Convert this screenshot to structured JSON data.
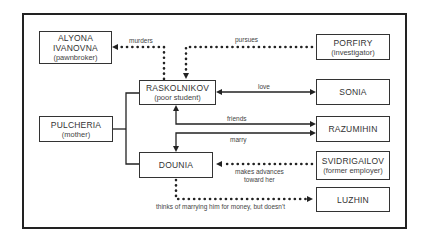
{
  "diagram": {
    "title": "",
    "nodes": [
      {
        "id": "alyona",
        "name": "ALYONA IVANOVNA",
        "name_lines": [
          "ALYONA",
          "IVANOVNA"
        ],
        "role": "(pawnbroker)"
      },
      {
        "id": "porfiry",
        "name": "PORFIRY",
        "role": "(investigator)"
      },
      {
        "id": "raskolnikov",
        "name": "RASKOLNIKOV",
        "role": "(poor student)"
      },
      {
        "id": "sonia",
        "name": "SONIA",
        "role": ""
      },
      {
        "id": "pulcheria",
        "name": "PULCHERIA",
        "role": "(mother)"
      },
      {
        "id": "razumihin",
        "name": "RAZUMIHIN",
        "role": ""
      },
      {
        "id": "dounia",
        "name": "DOUNIA",
        "role": ""
      },
      {
        "id": "svidrigailov",
        "name": "SVIDRIGAILOV",
        "role": "(former employer)"
      },
      {
        "id": "luzhin",
        "name": "LUZHIN",
        "role": ""
      }
    ],
    "edges": [
      {
        "from": "raskolnikov",
        "to": "alyona",
        "label": "murders",
        "style": "dotted"
      },
      {
        "from": "porfiry",
        "to": "raskolnikov",
        "label": "pursues",
        "style": "dotted"
      },
      {
        "from": "raskolnikov",
        "to": "sonia",
        "label": "love",
        "style": "solid",
        "bidirectional": true
      },
      {
        "from": "raskolnikov",
        "to": "razumihin",
        "label": "friends",
        "style": "solid",
        "bidirectional": true
      },
      {
        "from": "razumihin",
        "to": "dounia",
        "label": "marry",
        "style": "solid"
      },
      {
        "from": "svidrigailov",
        "to": "dounia",
        "label": "makes advances toward her",
        "label_lines": [
          "makes advances",
          "toward her"
        ],
        "style": "dotted"
      },
      {
        "from": "dounia",
        "to": "luzhin",
        "label": "thinks of marrying him for money, but doesn't",
        "style": "dotted"
      },
      {
        "from": "pulcheria",
        "to": [
          "raskolnikov",
          "dounia"
        ],
        "label": "",
        "style": "solid",
        "type": "family-branch"
      }
    ]
  }
}
